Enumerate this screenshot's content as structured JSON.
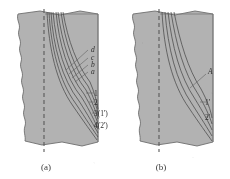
{
  "figure": {
    "background_color": "#ffffff",
    "specimen_fill_color": "#b2b2b2",
    "specimen_edge_color": "#6e6e6e",
    "curve_color": "#4a4a4a",
    "border_color": "#7a7a7a",
    "centerline_color": "#5a5a5a",
    "label_color": "#2e2e2e"
  },
  "panels": [
    {
      "id": "a",
      "caption": "(a)",
      "curve_count": 8,
      "labels": [
        {
          "text": "d",
          "style": "italic",
          "group": "letters"
        },
        {
          "text": "c",
          "style": "italic",
          "group": "letters"
        },
        {
          "text": "b",
          "style": "italic",
          "group": "letters"
        },
        {
          "text": "a",
          "style": "italic",
          "group": "letters"
        },
        {
          "text": "1",
          "style": "upright",
          "group": "numbers"
        },
        {
          "text": "2",
          "style": "upright",
          "group": "numbers"
        },
        {
          "text": "3(1')",
          "style": "upright",
          "group": "numbers"
        },
        {
          "text": "4(2')",
          "style": "upright",
          "group": "numbers"
        }
      ]
    },
    {
      "id": "b",
      "caption": "(b)",
      "curve_count": 5,
      "labels": [
        {
          "text": "A",
          "style": "italic",
          "group": "letters"
        },
        {
          "text": "1'",
          "style": "upright",
          "group": "numbers"
        },
        {
          "text": "2'",
          "style": "upright",
          "group": "numbers"
        }
      ]
    }
  ]
}
